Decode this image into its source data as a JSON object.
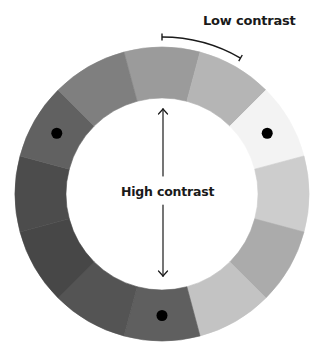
{
  "labels": {
    "low_contrast": "Low contrast",
    "high_contrast": "High contrast"
  },
  "wheel": {
    "center": [
      162,
      194
    ],
    "outer_radius": 147,
    "inner_radius": 96,
    "segment_count": 12,
    "segments": [
      {
        "angle": 0,
        "color": "#9b9b9b",
        "dot": false
      },
      {
        "angle": 30,
        "color": "#b5b5b5",
        "dot": false
      },
      {
        "angle": 60,
        "color": "#f3f3f3",
        "dot": true
      },
      {
        "angle": 90,
        "color": "#cdcdcd",
        "dot": false
      },
      {
        "angle": 120,
        "color": "#ababab",
        "dot": false
      },
      {
        "angle": 150,
        "color": "#c3c3c3",
        "dot": false
      },
      {
        "angle": 180,
        "color": "#5f5f5f",
        "dot": true
      },
      {
        "angle": 210,
        "color": "#545454",
        "dot": false
      },
      {
        "angle": 240,
        "color": "#474747",
        "dot": false
      },
      {
        "angle": 270,
        "color": "#4c4c4c",
        "dot": false
      },
      {
        "angle": 300,
        "color": "#616161",
        "dot": true
      },
      {
        "angle": 330,
        "color": "#7f7f7f",
        "dot": false
      }
    ],
    "dot_color": "#000000",
    "dot_radius": 5.5
  },
  "annotations": {
    "low_contrast_bracket": {
      "start_angle": 0,
      "end_angle": 30,
      "radius": 157
    },
    "high_contrast_arrow": {
      "x": 163,
      "top_y": 109,
      "bottom_y": 276,
      "gap_top": 176,
      "gap_bottom": 205
    },
    "stroke_color": "#1a1a1a"
  }
}
